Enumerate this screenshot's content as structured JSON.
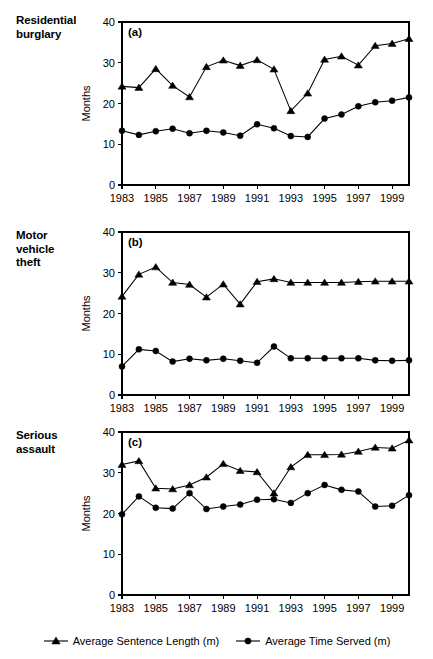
{
  "figure": {
    "panel_labels": [
      {
        "key": "a",
        "text": "Residential\nburglary",
        "tag": "(a)"
      },
      {
        "key": "b",
        "text": "Motor\nvehicle\ntheft",
        "tag": "(b)"
      },
      {
        "key": "c",
        "text": "Serious\nassault",
        "tag": "(c)"
      }
    ],
    "y_axis_title": "Months",
    "legend": [
      {
        "name": "sentence",
        "label": "Average Sentence Length (m)",
        "marker": "triangle",
        "color": "#000000"
      },
      {
        "name": "served",
        "label": "Average Time Served (m)",
        "marker": "circle",
        "color": "#000000"
      }
    ]
  },
  "chart_data": [
    {
      "type": "line",
      "panel": "(a)",
      "title": "Residential burglary",
      "xlabel": "",
      "ylabel": "Months",
      "ylim": [
        0,
        40
      ],
      "yticks": [
        0,
        10,
        20,
        30,
        40
      ],
      "xlim": [
        1983,
        2000
      ],
      "x": [
        1983,
        1984,
        1985,
        1986,
        1987,
        1988,
        1989,
        1990,
        1991,
        1992,
        1993,
        1994,
        1995,
        1996,
        1997,
        1998,
        1999,
        2000
      ],
      "xticks": [
        1983,
        1985,
        1987,
        1989,
        1991,
        1993,
        1995,
        1997,
        1999
      ],
      "xticklabels": [
        "1983",
        "1985",
        "1987",
        "1989",
        "1991",
        "1993",
        "1995",
        "1997",
        "1999"
      ],
      "grid": false,
      "legend_position": "below-figure",
      "series": [
        {
          "name": "Average Sentence Length (m)",
          "marker": "triangle",
          "values": [
            24.2,
            23.9,
            28.5,
            24.4,
            21.6,
            29.0,
            30.6,
            29.3,
            30.7,
            28.4,
            18.2,
            22.5,
            30.8,
            31.6,
            29.4,
            34.2,
            34.7,
            35.9
          ]
        },
        {
          "name": "Average Time Served (m)",
          "marker": "circle",
          "values": [
            13.3,
            12.3,
            13.2,
            13.8,
            12.7,
            13.3,
            12.9,
            12.1,
            14.9,
            13.9,
            12.0,
            11.8,
            16.3,
            17.3,
            19.3,
            20.3,
            20.7,
            21.5
          ]
        }
      ]
    },
    {
      "type": "line",
      "panel": "(b)",
      "title": "Motor vehicle theft",
      "xlabel": "",
      "ylabel": "Months",
      "ylim": [
        0,
        40
      ],
      "yticks": [
        0,
        10,
        20,
        30,
        40
      ],
      "xlim": [
        1983,
        2000
      ],
      "x": [
        1983,
        1984,
        1985,
        1986,
        1987,
        1988,
        1989,
        1990,
        1991,
        1992,
        1993,
        1994,
        1995,
        1996,
        1997,
        1998,
        1999,
        2000
      ],
      "xticks": [
        1983,
        1985,
        1987,
        1989,
        1991,
        1993,
        1995,
        1997,
        1999
      ],
      "xticklabels": [
        "1983",
        "1985",
        "1987",
        "1989",
        "1991",
        "1993",
        "1995",
        "1997",
        "1999"
      ],
      "grid": false,
      "legend_position": "below-figure",
      "series": [
        {
          "name": "Average Sentence Length (m)",
          "marker": "triangle",
          "values": [
            24.2,
            29.6,
            31.4,
            27.6,
            27.1,
            24.0,
            27.2,
            22.3,
            27.8,
            28.5,
            27.6,
            27.6,
            27.6,
            27.6,
            27.8,
            27.9,
            27.9,
            27.9
          ]
        },
        {
          "name": "Average Time Served (m)",
          "marker": "circle",
          "values": [
            7.0,
            11.2,
            10.8,
            8.2,
            8.9,
            8.5,
            8.9,
            8.4,
            7.9,
            11.9,
            9.0,
            9.0,
            9.0,
            9.0,
            9.0,
            8.5,
            8.4,
            8.5
          ]
        }
      ]
    },
    {
      "type": "line",
      "panel": "(c)",
      "title": "Serious assault",
      "xlabel": "",
      "ylabel": "Months",
      "ylim": [
        0,
        40
      ],
      "yticks": [
        0,
        10,
        20,
        30,
        40
      ],
      "xlim": [
        1983,
        2000
      ],
      "x": [
        1983,
        1984,
        1985,
        1986,
        1987,
        1988,
        1989,
        1990,
        1991,
        1992,
        1993,
        1994,
        1995,
        1996,
        1997,
        1998,
        1999,
        2000
      ],
      "xticks": [
        1983,
        1985,
        1987,
        1989,
        1991,
        1993,
        1995,
        1997,
        1999
      ],
      "xticklabels": [
        "1983",
        "1985",
        "1987",
        "1989",
        "1991",
        "1993",
        "1995",
        "1997",
        "1999"
      ],
      "grid": false,
      "legend_position": "below-figure",
      "series": [
        {
          "name": "Average Sentence Length (m)",
          "marker": "triangle",
          "values": [
            32.0,
            32.9,
            26.2,
            26.0,
            27.0,
            28.9,
            32.2,
            30.5,
            30.2,
            25.0,
            31.4,
            34.4,
            34.4,
            34.5,
            35.2,
            36.2,
            36.0,
            38.0
          ]
        },
        {
          "name": "Average Time Served (m)",
          "marker": "circle",
          "values": [
            19.8,
            24.2,
            21.4,
            21.2,
            25.0,
            21.1,
            21.7,
            22.2,
            23.4,
            23.5,
            22.6,
            25.0,
            27.0,
            25.8,
            25.4,
            21.7,
            21.9,
            24.5
          ]
        }
      ]
    }
  ]
}
